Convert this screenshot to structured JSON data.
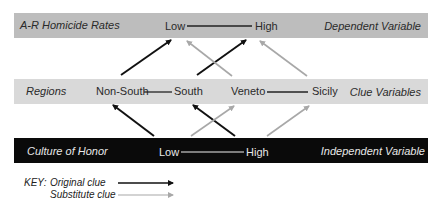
{
  "dependent": {
    "name": "A-R Homicide Rates",
    "low": "Low",
    "high": "High",
    "role": "Dependent Variable",
    "band_color": "#bdbdbd"
  },
  "clue": {
    "name": "Regions",
    "items": [
      "Non-South",
      "South",
      "Veneto",
      "Sicily"
    ],
    "role": "Clue Variables",
    "band_color": "#d9d9d9"
  },
  "independent": {
    "name": "Culture of Honor",
    "low": "Low",
    "high": "High",
    "role": "Independent Variable",
    "band_color": "#0a0a0a"
  },
  "key": {
    "title": "KEY:",
    "original": "Original clue",
    "substitute": "Substitute clue",
    "original_color": "#111111",
    "substitute_color": "#a8a8a8"
  }
}
